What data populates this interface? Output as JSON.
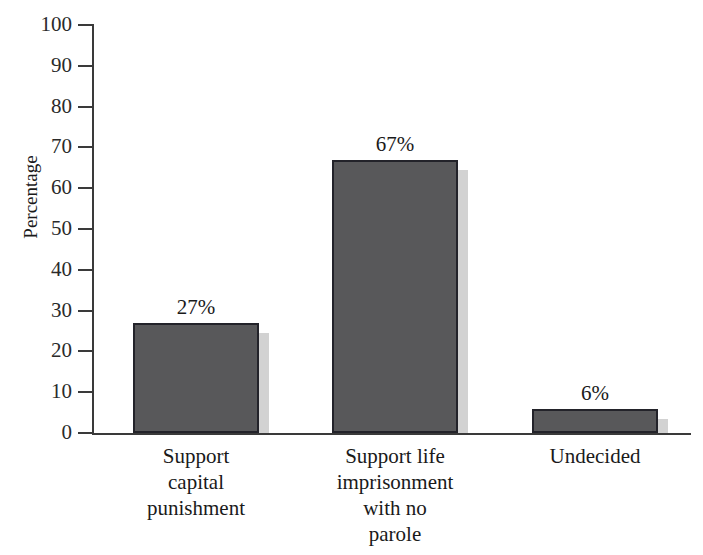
{
  "chart_data": {
    "type": "bar",
    "title": "",
    "xlabel": "",
    "ylabel": "Percentage",
    "ylim": [
      0,
      100
    ],
    "grid": false,
    "legend": "none",
    "categories": [
      "Support\ncapital\npunishment",
      "Support life\nimprisonment\nwith no\nparole",
      "Undecided"
    ],
    "values": [
      27,
      67,
      6
    ],
    "data_labels": [
      "27%",
      "67%",
      "6%"
    ],
    "yticks": [
      100,
      90,
      80,
      70,
      60,
      50,
      40,
      30,
      20,
      10,
      0
    ],
    "ytick_labels": [
      "100",
      "90",
      "80",
      "70",
      "60",
      "50",
      "40",
      "30",
      "20",
      "10",
      "0"
    ]
  },
  "axis": {
    "y_title": "Percentage"
  },
  "categories": [
    {
      "lines": [
        "Support",
        "capital",
        "punishment"
      ]
    },
    {
      "lines": [
        "Support life",
        "imprisonment",
        "with no",
        "parole"
      ]
    },
    {
      "lines": [
        "Undecided"
      ]
    }
  ],
  "bars": [
    {
      "label": "27%",
      "value": 27
    },
    {
      "label": "67%",
      "value": 67
    },
    {
      "label": "6%",
      "value": 6
    }
  ],
  "colors": {
    "bar_fill": "#58585a",
    "bar_outline": "#23232a",
    "bar_shadow": "#d2d2d2",
    "axis": "#3a3a3a",
    "text": "#1a1a1a"
  }
}
